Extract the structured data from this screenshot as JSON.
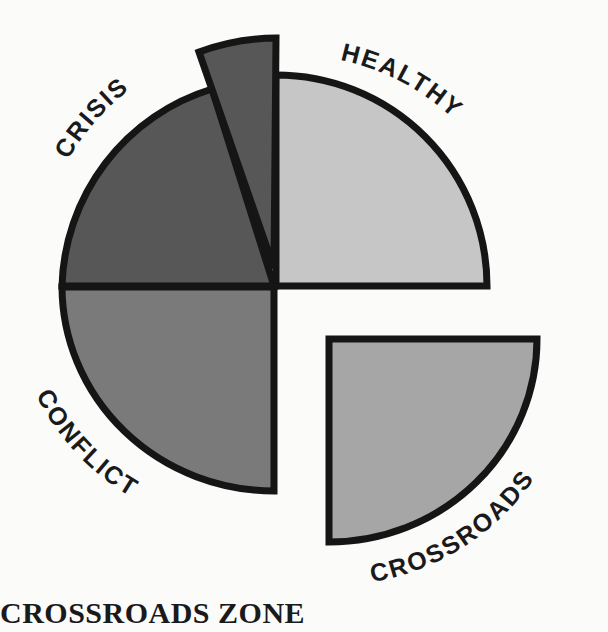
{
  "diagram": {
    "title": "CROSSROADS ZONE",
    "segments": [
      {
        "id": "healthy",
        "label": "HEALTHY",
        "fill": "#c6c6c6"
      },
      {
        "id": "crisis",
        "label": "CRISIS",
        "fill": "#575757"
      },
      {
        "id": "conflict",
        "label": "CONFLICT",
        "fill": "#7a7a7a"
      },
      {
        "id": "crossroads",
        "label": "CROSSROADS",
        "fill": "#a6a6a6"
      }
    ],
    "stroke": "#151515"
  }
}
